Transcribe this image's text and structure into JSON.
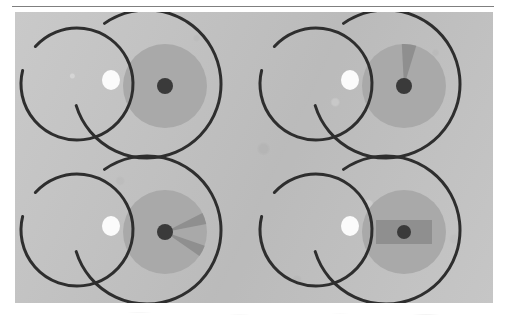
{
  "figure": {
    "domain": "Diagram",
    "caption": "",
    "panel": {
      "background_color": "#c3c3c3",
      "x": 15,
      "y": 12,
      "width": 478,
      "height": 291,
      "texture": "grainy-halftone-scan"
    },
    "header_rule": {
      "visible": true,
      "color": "#7f7f7f",
      "x": 12,
      "y": 6,
      "width": 482,
      "thickness": 1
    },
    "style": {
      "stroke_color": "#2e2e2e",
      "stroke_width": 3.0,
      "disk_color": "#a9a9a9",
      "wedge_color": "#8f8f8f",
      "bar_color": "#8f8f8f",
      "core_color": "#3a3a3a",
      "spot_color": "#fbfbfb"
    },
    "layout": {
      "type": "grid",
      "rows": 2,
      "columns": 2,
      "cell_width": 239,
      "cell_height": 145
    },
    "cells": [
      {
        "id": "cell-top-left",
        "row": 0,
        "column": 0,
        "label": "",
        "left_arc": {
          "shape": "open-circle",
          "center_x": 62,
          "center_y": 72,
          "radius": 56,
          "start_angle_deg": 166,
          "sweep_deg": 332,
          "opening": "left"
        },
        "right_arc": {
          "shape": "open-arc",
          "center_x": 132,
          "center_y": 72,
          "radius": 74,
          "start_angle_deg": -163,
          "sweep_deg": 288,
          "opening": "right"
        },
        "crossing_spot": {
          "visible": true,
          "center_x": 96,
          "center_y": 68,
          "radius_x": 9,
          "radius_y": 10
        },
        "disk": {
          "center_x": 150,
          "center_y": 74,
          "radius": 42
        },
        "core": {
          "center_x": 150,
          "center_y": 74,
          "radius": 8
        },
        "wedges": [],
        "bar": null
      },
      {
        "id": "cell-top-right",
        "row": 0,
        "column": 1,
        "label": "",
        "left_arc": {
          "shape": "open-circle",
          "center_x": 62,
          "center_y": 72,
          "radius": 56,
          "start_angle_deg": 166,
          "sweep_deg": 332,
          "opening": "left"
        },
        "right_arc": {
          "shape": "open-arc",
          "center_x": 132,
          "center_y": 72,
          "radius": 74,
          "start_angle_deg": -163,
          "sweep_deg": 288,
          "opening": "right"
        },
        "crossing_spot": {
          "visible": true,
          "center_x": 96,
          "center_y": 68,
          "radius_x": 9,
          "radius_y": 10
        },
        "disk": {
          "center_x": 150,
          "center_y": 74,
          "radius": 42
        },
        "core": {
          "center_x": 150,
          "center_y": 74,
          "radius": 8
        },
        "wedges": [
          {
            "direction_deg": 83,
            "half_width_deg": 10,
            "length": 42
          }
        ],
        "bar": null
      },
      {
        "id": "cell-bottom-left",
        "row": 1,
        "column": 0,
        "label": "",
        "left_arc": {
          "shape": "open-circle",
          "center_x": 62,
          "center_y": 72,
          "radius": 56,
          "start_angle_deg": 166,
          "sweep_deg": 332,
          "opening": "left"
        },
        "right_arc": {
          "shape": "open-arc",
          "center_x": 132,
          "center_y": 72,
          "radius": 74,
          "start_angle_deg": -163,
          "sweep_deg": 288,
          "opening": "right"
        },
        "crossing_spot": {
          "visible": true,
          "center_x": 96,
          "center_y": 68,
          "radius_x": 9,
          "radius_y": 10
        },
        "disk": {
          "center_x": 150,
          "center_y": 74,
          "radius": 42
        },
        "core": {
          "center_x": 150,
          "center_y": 74,
          "radius": 8
        },
        "wedges": [
          {
            "direction_deg": 19,
            "half_width_deg": 8,
            "length": 42
          },
          {
            "direction_deg": -27,
            "half_width_deg": 8,
            "length": 42
          }
        ],
        "bar": null
      },
      {
        "id": "cell-bottom-right",
        "row": 1,
        "column": 1,
        "label": "",
        "left_arc": {
          "shape": "open-circle",
          "center_x": 62,
          "center_y": 72,
          "radius": 56,
          "start_angle_deg": 166,
          "sweep_deg": 332,
          "opening": "left"
        },
        "right_arc": {
          "shape": "open-arc",
          "center_x": 132,
          "center_y": 72,
          "radius": 74,
          "start_angle_deg": -163,
          "sweep_deg": 288,
          "opening": "right"
        },
        "crossing_spot": {
          "visible": true,
          "center_x": 96,
          "center_y": 68,
          "radius_x": 9,
          "radius_y": 10
        },
        "disk": {
          "center_x": 150,
          "center_y": 74,
          "radius": 42
        },
        "core": {
          "center_x": 150,
          "center_y": 74,
          "radius": 7
        },
        "wedges": [],
        "bar": {
          "center_x": 150,
          "center_y": 74,
          "width": 56,
          "height": 24
        }
      }
    ]
  }
}
